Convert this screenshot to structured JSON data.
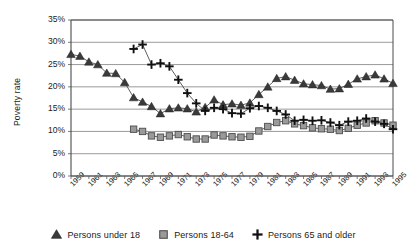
{
  "chart_data": {
    "type": "line",
    "title": "",
    "xlabel": "",
    "ylabel": "Poverty rate",
    "ylim": [
      0,
      35
    ],
    "ytick_labels": [
      "0%",
      "5%",
      "10%",
      "15%",
      "20%",
      "25%",
      "30%",
      "35%"
    ],
    "ytick_values": [
      0,
      5,
      10,
      15,
      20,
      25,
      30,
      35
    ],
    "grid": true,
    "legend_position": "bottom",
    "xlim": [
      1959,
      1995
    ],
    "x": [
      1959,
      1960,
      1961,
      1962,
      1963,
      1964,
      1965,
      1966,
      1967,
      1968,
      1969,
      1970,
      1971,
      1972,
      1973,
      1974,
      1975,
      1976,
      1977,
      1978,
      1979,
      1980,
      1981,
      1982,
      1983,
      1984,
      1985,
      1986,
      1987,
      1988,
      1989,
      1990,
      1991,
      1992,
      1993,
      1994,
      1995
    ],
    "xtick_labels": [
      "1959",
      "1961",
      "1963",
      "1965",
      "1967",
      "1969",
      "1971",
      "1973",
      "1975",
      "1977",
      "1979",
      "1981",
      "1983",
      "1985",
      "1987",
      "1989",
      "1991",
      "1993",
      "1995"
    ],
    "xtick_values": [
      1959,
      1961,
      1963,
      1965,
      1967,
      1969,
      1971,
      1973,
      1975,
      1977,
      1979,
      1981,
      1983,
      1985,
      1987,
      1989,
      1991,
      1993,
      1995
    ],
    "series": [
      {
        "name": "Persons under 18",
        "marker": "triangle",
        "color": "#3a3a3a",
        "x": [
          1959,
          1960,
          1961,
          1962,
          1963,
          1964,
          1965,
          1966,
          1967,
          1968,
          1969,
          1970,
          1971,
          1972,
          1973,
          1974,
          1975,
          1976,
          1977,
          1978,
          1979,
          1980,
          1981,
          1982,
          1983,
          1984,
          1985,
          1986,
          1987,
          1988,
          1989,
          1990,
          1991,
          1992,
          1993,
          1994,
          1995
        ],
        "values": [
          27.3,
          26.9,
          25.6,
          25.0,
          23.1,
          23.0,
          21.0,
          17.6,
          16.6,
          15.6,
          14.0,
          15.1,
          15.3,
          15.1,
          14.4,
          15.4,
          17.1,
          16.0,
          16.2,
          15.9,
          16.4,
          18.3,
          20.0,
          21.9,
          22.3,
          21.5,
          20.7,
          20.5,
          20.3,
          19.5,
          19.6,
          20.6,
          21.8,
          22.3,
          22.7,
          21.8,
          20.8
        ]
      },
      {
        "name": "Persons 18-64",
        "marker": "square",
        "color": "#9a9a9a",
        "x": [
          1966,
          1967,
          1968,
          1969,
          1970,
          1971,
          1972,
          1973,
          1974,
          1975,
          1976,
          1977,
          1978,
          1979,
          1980,
          1981,
          1982,
          1983,
          1984,
          1985,
          1986,
          1987,
          1988,
          1989,
          1990,
          1991,
          1992,
          1993,
          1994,
          1995
        ],
        "values": [
          10.5,
          10.0,
          9.0,
          8.7,
          9.0,
          9.3,
          8.8,
          8.3,
          8.3,
          9.2,
          9.0,
          8.8,
          8.7,
          8.9,
          10.1,
          11.1,
          12.0,
          12.4,
          11.7,
          11.3,
          10.8,
          10.6,
          10.5,
          10.2,
          10.7,
          11.4,
          11.9,
          12.4,
          11.9,
          11.4
        ]
      },
      {
        "name": "Persons 65 and older",
        "marker": "plus",
        "color": "#111111",
        "x": [
          1966,
          1967,
          1968,
          1969,
          1970,
          1971,
          1972,
          1973,
          1974,
          1975,
          1976,
          1977,
          1978,
          1979,
          1980,
          1981,
          1982,
          1983,
          1984,
          1985,
          1986,
          1987,
          1988,
          1989,
          1990,
          1991,
          1992,
          1993,
          1994,
          1995
        ],
        "values": [
          28.5,
          29.5,
          25.0,
          25.3,
          24.6,
          21.6,
          18.6,
          16.3,
          14.6,
          15.3,
          15.0,
          14.1,
          14.0,
          15.2,
          15.7,
          15.3,
          14.6,
          13.8,
          12.4,
          12.6,
          12.4,
          12.5,
          12.0,
          11.4,
          12.2,
          12.4,
          12.9,
          12.2,
          11.7,
          10.5
        ]
      }
    ]
  },
  "legend": {
    "items": [
      {
        "label": "Persons under 18",
        "marker": "triangle"
      },
      {
        "label": "Persons 18-64",
        "marker": "square"
      },
      {
        "label": "Persons 65 and older",
        "marker": "plus"
      }
    ]
  }
}
